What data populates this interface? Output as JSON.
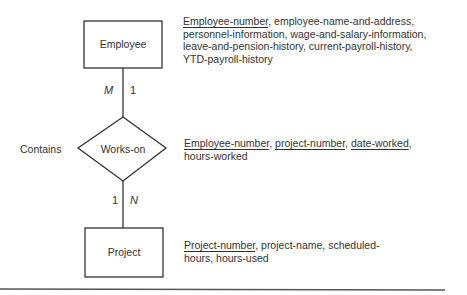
{
  "entities": {
    "employee": {
      "label": "Employee"
    },
    "project": {
      "label": "Project"
    }
  },
  "relationship": {
    "label": "Works-on",
    "side_label": "Contains"
  },
  "cardinality": {
    "employee_side_left": "M",
    "employee_side_right": "1",
    "project_side_left": "1",
    "project_side_right": "N"
  },
  "attributes": {
    "employee": {
      "key": "Employee-number",
      "rest": ", employee-name-and-address, personnel-information, wage-and-salary-information, leave-and-pension-history, current-payroll-history, YTD-payroll-history"
    },
    "works_on": {
      "key1": "Employee-number",
      "sep1": ", ",
      "key2": "project-number",
      "sep2": ", ",
      "key3": "date-worked",
      "rest": ", hours-worked"
    },
    "project": {
      "key": "Project-number",
      "rest": ", project-name, scheduled-hours, hours-used"
    }
  },
  "colors": {
    "line": "#333333",
    "text": "#333333",
    "rule": "#555555"
  }
}
